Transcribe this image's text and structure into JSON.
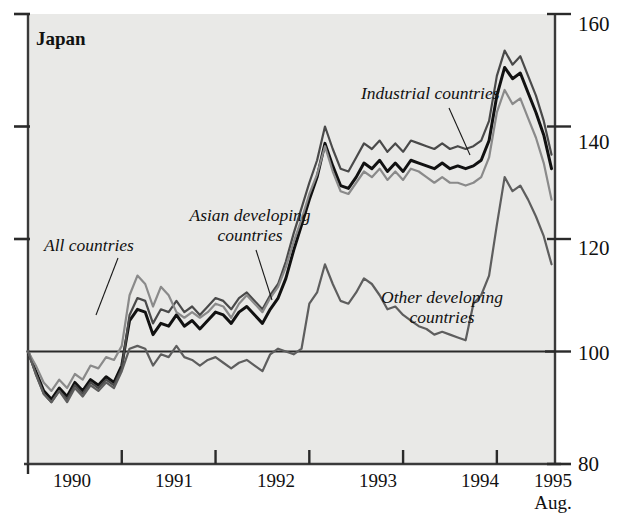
{
  "chart_data": {
    "type": "line",
    "title": "Japan",
    "xlabel": "",
    "ylabel": "",
    "xlim": [
      1990.0,
      1995.62
    ],
    "ylim": [
      80,
      160
    ],
    "grid": false,
    "legend_position": "inline-annotations",
    "reference_line": {
      "value": 100,
      "label": "100"
    },
    "y_ticks": [
      80,
      100,
      120,
      140,
      160
    ],
    "y_tick_labels": [
      "80",
      "100",
      "120",
      "140",
      "160"
    ],
    "y_axis_side": "right",
    "left_axis_ticks": [
      120,
      140,
      160
    ],
    "x_ticks": [
      1990,
      1991,
      1992,
      1993,
      1994,
      1995
    ],
    "x_tick_labels": [
      "1990",
      "1991",
      "1992",
      "1993",
      "1994",
      "1995"
    ],
    "x_end_note": "Aug.",
    "x": [
      1990.0,
      1990.083,
      1990.167,
      1990.25,
      1990.333,
      1990.417,
      1990.5,
      1990.583,
      1990.667,
      1990.75,
      1990.833,
      1990.917,
      1991.0,
      1991.083,
      1991.167,
      1991.25,
      1991.333,
      1991.417,
      1991.5,
      1991.583,
      1991.667,
      1991.75,
      1991.833,
      1991.917,
      1992.0,
      1992.083,
      1992.167,
      1992.25,
      1992.333,
      1992.417,
      1992.5,
      1992.583,
      1992.667,
      1992.75,
      1992.833,
      1992.917,
      1993.0,
      1993.083,
      1993.167,
      1993.25,
      1993.333,
      1993.417,
      1993.5,
      1993.583,
      1993.667,
      1993.75,
      1993.833,
      1993.917,
      1994.0,
      1994.083,
      1994.167,
      1994.25,
      1994.333,
      1994.417,
      1994.5,
      1994.583,
      1994.667,
      1994.75,
      1994.833,
      1994.917,
      1995.0,
      1995.083,
      1995.167,
      1995.25,
      1995.333,
      1995.417,
      1995.5,
      1995.583
    ],
    "series": [
      {
        "name": "All countries",
        "color": "#111111",
        "width": 3.0,
        "values": [
          100.0,
          96.5,
          93.0,
          91.5,
          93.5,
          92.0,
          94.5,
          93.0,
          95.0,
          94.0,
          95.5,
          94.5,
          97.5,
          105.5,
          107.5,
          107.0,
          103.0,
          105.0,
          104.5,
          106.5,
          104.5,
          105.5,
          104.0,
          105.5,
          107.0,
          106.5,
          105.0,
          107.0,
          108.0,
          106.5,
          105.0,
          107.5,
          109.5,
          113.0,
          118.0,
          122.5,
          127.0,
          131.0,
          137.0,
          133.0,
          129.5,
          129.0,
          131.0,
          133.5,
          132.5,
          134.0,
          132.0,
          133.5,
          132.0,
          134.0,
          133.5,
          133.0,
          132.5,
          133.5,
          132.5,
          133.0,
          132.5,
          133.0,
          134.0,
          137.5,
          145.5,
          150.5,
          148.5,
          149.5,
          146.0,
          142.5,
          138.5,
          132.5
        ]
      },
      {
        "name": "Industrial countries",
        "color": "#4a4a4a",
        "width": 2.2,
        "values": [
          100.0,
          96.0,
          92.5,
          91.0,
          93.0,
          91.5,
          94.0,
          92.5,
          94.5,
          93.5,
          95.0,
          94.0,
          97.0,
          106.5,
          109.5,
          109.0,
          105.0,
          107.5,
          107.0,
          109.0,
          107.0,
          108.0,
          106.5,
          108.0,
          109.5,
          109.0,
          107.5,
          109.5,
          110.5,
          109.0,
          107.5,
          110.0,
          112.0,
          116.0,
          121.0,
          125.5,
          130.0,
          134.0,
          140.0,
          136.0,
          132.5,
          132.0,
          134.5,
          137.0,
          136.0,
          137.5,
          135.5,
          137.0,
          135.5,
          137.5,
          137.0,
          136.5,
          136.0,
          137.0,
          136.0,
          136.5,
          136.0,
          136.5,
          137.5,
          141.0,
          149.0,
          153.5,
          151.0,
          152.5,
          149.0,
          145.5,
          141.0,
          135.0
        ]
      },
      {
        "name": "Asian developing countries",
        "color": "#8a8a8a",
        "width": 2.2,
        "values": [
          100.0,
          97.5,
          94.5,
          93.0,
          95.0,
          93.5,
          96.0,
          95.0,
          97.5,
          97.0,
          99.0,
          98.5,
          101.0,
          110.0,
          113.5,
          112.0,
          108.0,
          111.5,
          110.0,
          107.0,
          106.0,
          107.0,
          106.0,
          107.0,
          108.5,
          108.0,
          106.0,
          108.5,
          110.0,
          108.5,
          107.0,
          109.5,
          111.5,
          115.0,
          119.5,
          123.5,
          128.0,
          131.5,
          136.5,
          132.0,
          128.5,
          128.0,
          130.0,
          132.0,
          131.0,
          132.5,
          130.5,
          132.0,
          130.5,
          132.5,
          132.0,
          131.0,
          130.0,
          131.0,
          130.0,
          130.0,
          129.5,
          130.0,
          131.0,
          134.5,
          142.5,
          146.5,
          144.0,
          145.0,
          141.5,
          138.0,
          133.5,
          127.0
        ]
      },
      {
        "name": "Other developing countries",
        "color": "#5e5e5e",
        "width": 2.2,
        "values": [
          100.0,
          96.0,
          92.5,
          91.0,
          93.0,
          91.0,
          93.5,
          92.0,
          94.0,
          93.0,
          94.5,
          93.5,
          96.5,
          100.5,
          101.0,
          100.5,
          97.5,
          99.5,
          99.0,
          101.0,
          99.0,
          98.5,
          97.5,
          98.5,
          99.0,
          98.0,
          97.0,
          98.0,
          98.5,
          97.5,
          96.5,
          99.5,
          100.5,
          100.0,
          99.5,
          100.5,
          108.5,
          110.5,
          115.5,
          112.0,
          109.0,
          108.5,
          110.5,
          113.0,
          112.0,
          110.0,
          107.5,
          108.0,
          106.5,
          105.5,
          104.5,
          104.0,
          103.0,
          103.5,
          103.0,
          102.5,
          102.0,
          108.5,
          110.0,
          113.5,
          122.5,
          131.0,
          128.5,
          129.5,
          127.0,
          124.0,
          120.5,
          115.5
        ]
      }
    ],
    "annotations": [
      {
        "name": "All countries",
        "text_lines": [
          "All countries"
        ],
        "leader": true
      },
      {
        "name": "Asian developing countries",
        "text_lines": [
          "Asian developing",
          "countries"
        ],
        "leader": true
      },
      {
        "name": "Industrial countries",
        "text_lines": [
          "Industrial countries"
        ],
        "leader": true
      },
      {
        "name": "Other developing countries",
        "text_lines": [
          "Other developing",
          "countries"
        ],
        "leader": false
      }
    ]
  },
  "labels": {
    "title": "Japan",
    "y": {
      "t160": "160",
      "t140": "140",
      "t120": "120",
      "t100": "100",
      "t80": "80"
    },
    "x": {
      "y1990": "1990",
      "y1991": "1991",
      "y1992": "1992",
      "y1993": "1993",
      "y1994": "1994",
      "y1995": "1995",
      "aug": "Aug."
    },
    "ann": {
      "all_countries": "All countries",
      "asian_1": "Asian developing",
      "asian_2": "countries",
      "industrial": "Industrial countries",
      "other_1": "Other developing",
      "other_2": "countries"
    }
  }
}
